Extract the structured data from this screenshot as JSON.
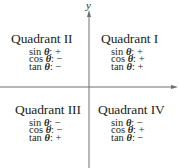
{
  "axes": {
    "y_label": "y",
    "x_label": "",
    "color": "#6d6e71"
  },
  "quadrants": [
    {
      "id": "II",
      "title": "Quadrant II",
      "stats": [
        {
          "fn": "sin",
          "sign": "+"
        },
        {
          "fn": "cos",
          "sign": "−"
        },
        {
          "fn": "tan",
          "sign": "−"
        }
      ]
    },
    {
      "id": "I",
      "title": "Quadrant I",
      "stats": [
        {
          "fn": "sin",
          "sign": "+"
        },
        {
          "fn": "cos",
          "sign": "+"
        },
        {
          "fn": "tan",
          "sign": "+"
        }
      ]
    },
    {
      "id": "III",
      "title": "Quadrant III",
      "stats": [
        {
          "fn": "sin",
          "sign": "−"
        },
        {
          "fn": "cos",
          "sign": "−"
        },
        {
          "fn": "tan",
          "sign": "+"
        }
      ]
    },
    {
      "id": "IV",
      "title": "Quadrant IV",
      "stats": [
        {
          "fn": "sin",
          "sign": "−"
        },
        {
          "fn": "cos",
          "sign": "+"
        },
        {
          "fn": "tan",
          "sign": "−"
        }
      ]
    }
  ],
  "symbols": {
    "theta": "θ",
    "colon": ":"
  }
}
